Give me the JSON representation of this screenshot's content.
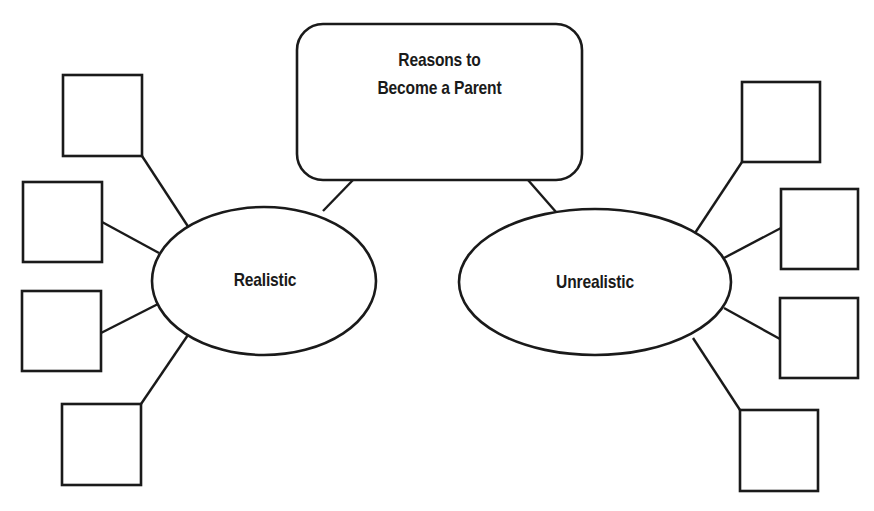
{
  "diagram": {
    "type": "concept-map",
    "title": {
      "line1": "Reasons to",
      "line2": "Become a Parent"
    },
    "branches": [
      {
        "label": "Realistic",
        "blank_boxes": 4
      },
      {
        "label": "Unrealistic",
        "blank_boxes": 4
      }
    ],
    "colors": {
      "stroke": "#1a1a1a",
      "fill": "#ffffff",
      "background": "#ffffff"
    }
  }
}
